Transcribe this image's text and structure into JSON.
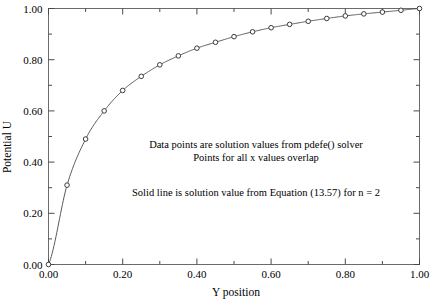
{
  "chart_data": {
    "type": "line",
    "title": "",
    "xlabel": "Y position",
    "ylabel": "Potential U",
    "xlim": [
      0.0,
      1.0
    ],
    "ylim": [
      0.0,
      1.0
    ],
    "grid": false,
    "legend": null,
    "xticks": [
      "0.00",
      "0.20",
      "0.40",
      "0.60",
      "0.80",
      "1.00"
    ],
    "xtick_values": [
      0.0,
      0.2,
      0.4,
      0.6,
      0.8,
      1.0
    ],
    "xminor_values": [
      0.1,
      0.3,
      0.5,
      0.7,
      0.9
    ],
    "yticks": [
      "0.00",
      "0.20",
      "0.40",
      "0.60",
      "0.80",
      "1.00"
    ],
    "ytick_values": [
      0.0,
      0.2,
      0.4,
      0.6,
      0.8,
      1.0
    ],
    "yminor_values": [
      0.1,
      0.3,
      0.5,
      0.7,
      0.9
    ],
    "x": [
      0.0,
      0.05,
      0.1,
      0.15,
      0.2,
      0.25,
      0.3,
      0.35,
      0.4,
      0.45,
      0.5,
      0.55,
      0.6,
      0.65,
      0.7,
      0.75,
      0.8,
      0.85,
      0.9,
      0.95,
      1.0
    ],
    "values": [
      0.0,
      0.31,
      0.49,
      0.6,
      0.68,
      0.735,
      0.78,
      0.815,
      0.845,
      0.868,
      0.89,
      0.909,
      0.925,
      0.938,
      0.95,
      0.961,
      0.971,
      0.979,
      0.986,
      0.993,
      1.0
    ],
    "series": [
      {
        "name": "pdefe() solver data points",
        "marker": "open-circle",
        "values": [
          0.0,
          0.31,
          0.49,
          0.6,
          0.68,
          0.735,
          0.78,
          0.815,
          0.845,
          0.868,
          0.89,
          0.909,
          0.925,
          0.938,
          0.95,
          0.961,
          0.971,
          0.979,
          0.986,
          0.993,
          1.0
        ]
      },
      {
        "name": "Equation (13.57) solid line, n = 2",
        "marker": "none",
        "values": [
          0.0,
          0.31,
          0.49,
          0.6,
          0.68,
          0.735,
          0.78,
          0.815,
          0.845,
          0.868,
          0.89,
          0.909,
          0.925,
          0.938,
          0.95,
          0.961,
          0.971,
          0.979,
          0.986,
          0.993,
          1.0
        ]
      }
    ],
    "annotations": [
      "Data points are solution values from pdefe() solver",
      "Points for all x values overlap",
      "Solid line is solution value from Equation (13.57) for n = 2"
    ]
  },
  "axes": {
    "x_title": "Y position",
    "y_title": "Potential U"
  },
  "annotations": {
    "line1": "Data points are solution values from pdefe() solver",
    "line2": "Points for all x values overlap",
    "line3": "Solid line is solution value from Equation (13.57) for n = 2"
  },
  "colors": {
    "curve": "#5a5a5a",
    "marker_stroke": "#3a3a3a",
    "frame": "#6b6b6b",
    "text": "#000000",
    "background": "#ffffff"
  }
}
